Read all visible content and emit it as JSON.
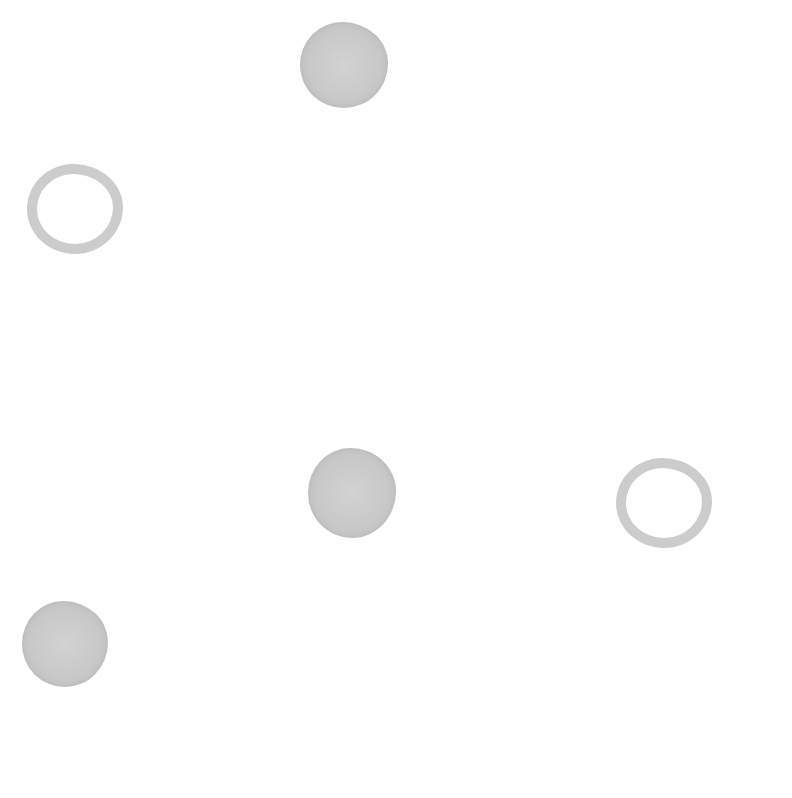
{
  "scene": {
    "background": "#ffffff",
    "shapes": [
      {
        "id": "filled-circle-top",
        "type": "filled",
        "x": 300,
        "y": 22,
        "w": 88,
        "h": 86,
        "color": "#c8c8c8"
      },
      {
        "id": "ring-left",
        "type": "ring",
        "x": 27,
        "y": 164,
        "w": 96,
        "h": 90,
        "color": "#cccccc",
        "stroke": 10
      },
      {
        "id": "filled-circle-center",
        "type": "filled",
        "x": 308,
        "y": 448,
        "w": 88,
        "h": 90,
        "color": "#cdcdcd"
      },
      {
        "id": "ring-right",
        "type": "ring",
        "x": 616,
        "y": 458,
        "w": 96,
        "h": 90,
        "color": "#cccccc",
        "stroke": 10
      },
      {
        "id": "filled-circle-bottom-left",
        "type": "filled",
        "x": 22,
        "y": 601,
        "w": 86,
        "h": 86,
        "color": "#d2d2d2"
      }
    ]
  }
}
